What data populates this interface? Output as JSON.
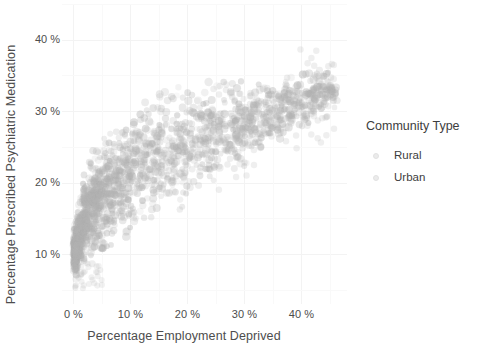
{
  "chart_data": {
    "type": "scatter",
    "title": "",
    "xlabel": "Percentage Employment Deprived",
    "ylabel": "Percentage Prescribed Psychiatric Medication",
    "xlim": [
      -2,
      48
    ],
    "ylim": [
      3,
      45
    ],
    "x_ticks": [
      0,
      10,
      20,
      30,
      40
    ],
    "x_tick_labels": [
      "0 %",
      "10 %",
      "20 %",
      "30 %",
      "40 %"
    ],
    "y_ticks": [
      10,
      20,
      30,
      40
    ],
    "y_tick_labels": [
      "10 %",
      "20 %",
      "30 %",
      "40 %"
    ],
    "grid": true,
    "grid_color": "#f2f2f2",
    "background": "#ffffff",
    "legend": {
      "title": "Community Type",
      "position": "right",
      "entries": [
        {
          "label": "Rural",
          "color": "#e8e8e8",
          "marker": "circle"
        },
        {
          "label": "Urban",
          "color": "#e8e8e8",
          "marker": "circle"
        }
      ]
    },
    "point_style": {
      "color": "#b4b4b4",
      "alpha": 0.14,
      "size": 3.4,
      "shape": "circle"
    },
    "series": [
      {
        "name": "Rural",
        "n_points": 1400,
        "x_range": [
          0,
          26
        ],
        "y_range": [
          5,
          38
        ]
      },
      {
        "name": "Urban",
        "n_points": 2600,
        "x_range": [
          0,
          46
        ],
        "y_range": [
          6,
          39
        ]
      }
    ],
    "cloud_spine": [
      {
        "x": 0.4,
        "y_low": 7.5,
        "y_high": 13.5,
        "y_mid": 10.5
      },
      {
        "x": 1.5,
        "y_low": 8.5,
        "y_high": 19.0,
        "y_mid": 13.5
      },
      {
        "x": 3.0,
        "y_low": 9.5,
        "y_high": 23.0,
        "y_mid": 16.5
      },
      {
        "x": 5.0,
        "y_low": 10.5,
        "y_high": 25.5,
        "y_mid": 18.5
      },
      {
        "x": 7.5,
        "y_low": 12.0,
        "y_high": 27.0,
        "y_mid": 20.0
      },
      {
        "x": 10.0,
        "y_low": 13.0,
        "y_high": 28.5,
        "y_mid": 21.5
      },
      {
        "x": 13.0,
        "y_low": 14.5,
        "y_high": 30.5,
        "y_mid": 23.0
      },
      {
        "x": 16.0,
        "y_low": 16.0,
        "y_high": 31.5,
        "y_mid": 24.0
      },
      {
        "x": 19.0,
        "y_low": 17.0,
        "y_high": 32.5,
        "y_mid": 25.0
      },
      {
        "x": 22.0,
        "y_low": 18.5,
        "y_high": 33.0,
        "y_mid": 26.0
      },
      {
        "x": 25.0,
        "y_low": 20.0,
        "y_high": 33.5,
        "y_mid": 26.5
      },
      {
        "x": 28.0,
        "y_low": 21.5,
        "y_high": 33.5,
        "y_mid": 27.5
      },
      {
        "x": 31.0,
        "y_low": 23.0,
        "y_high": 34.0,
        "y_mid": 28.5
      },
      {
        "x": 34.0,
        "y_low": 25.0,
        "y_high": 34.0,
        "y_mid": 29.5
      },
      {
        "x": 37.0,
        "y_low": 27.0,
        "y_high": 34.5,
        "y_mid": 30.5
      },
      {
        "x": 41.0,
        "y_low": 29.0,
        "y_high": 35.0,
        "y_mid": 31.5
      },
      {
        "x": 45.0,
        "y_low": 31.0,
        "y_high": 36.0,
        "y_mid": 33.0
      }
    ]
  }
}
